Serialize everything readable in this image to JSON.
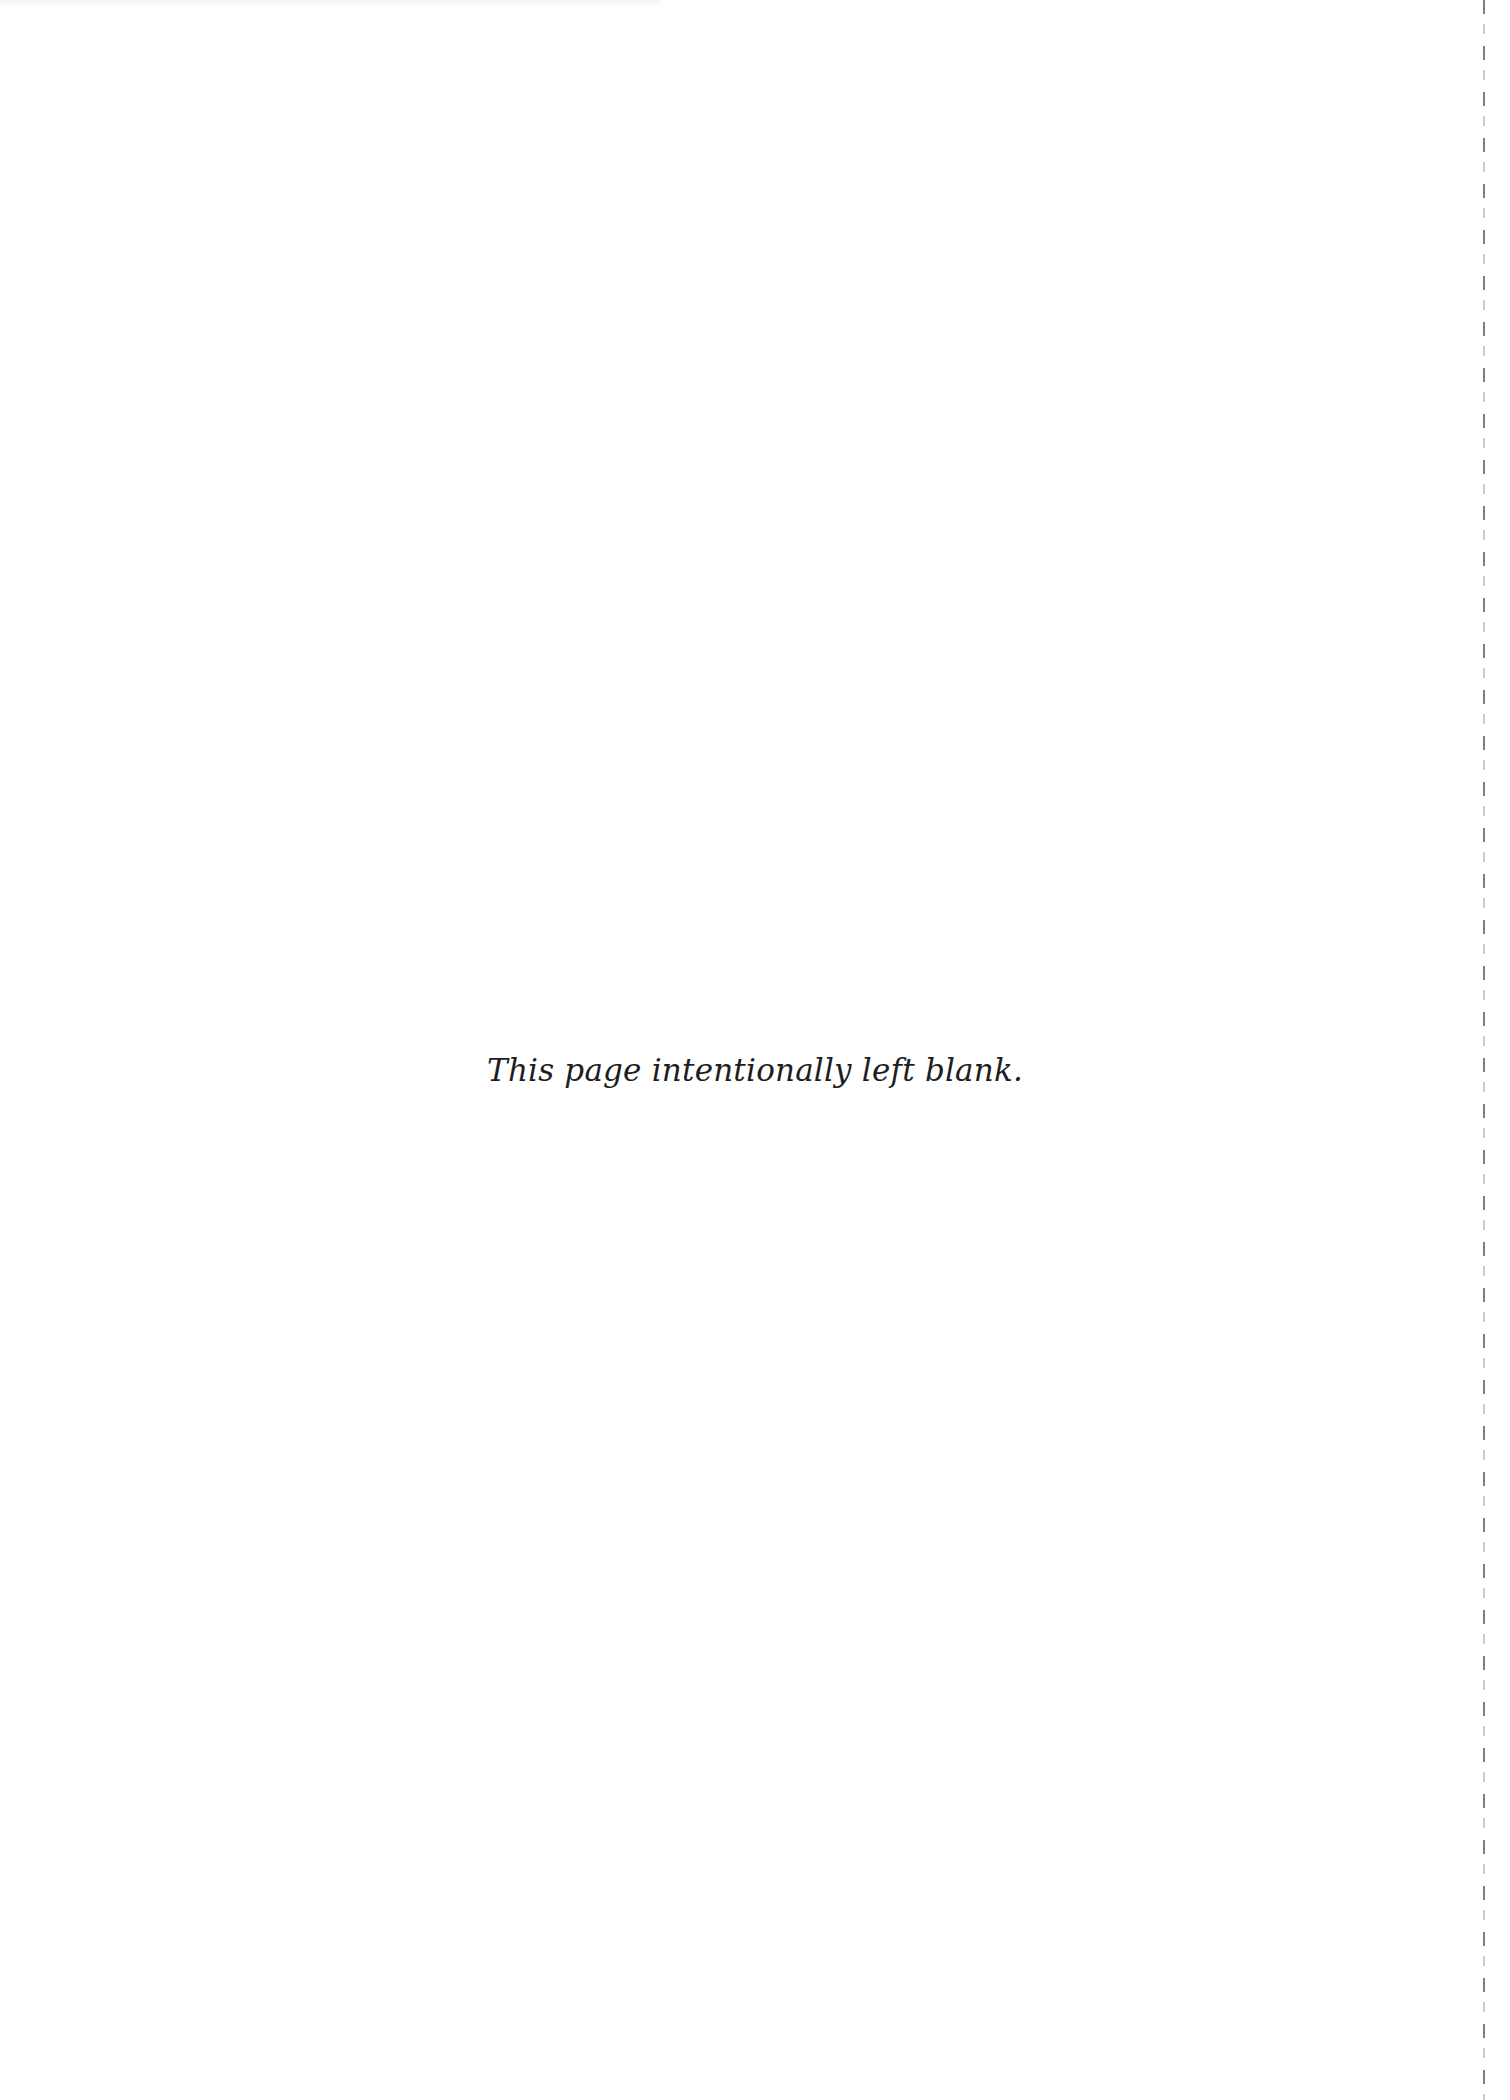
{
  "page": {
    "notice": "This page intentionally left blank."
  }
}
